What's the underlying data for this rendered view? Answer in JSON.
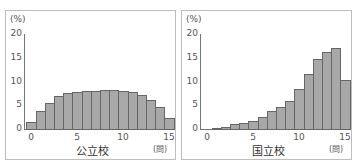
{
  "chart_data": [
    {
      "type": "bar",
      "title": "公立校",
      "xlabel": "(問)",
      "ylabel": "(%)",
      "ylim": [
        0,
        20
      ],
      "yticks": [
        0,
        5,
        10,
        15,
        20
      ],
      "xticks": [
        0,
        5,
        10,
        15
      ],
      "categories": [
        0,
        1,
        2,
        3,
        4,
        5,
        6,
        7,
        8,
        9,
        10,
        11,
        12,
        13,
        14,
        15
      ],
      "values": [
        1.5,
        3.8,
        5.5,
        6.9,
        7.5,
        7.8,
        8.0,
        8.0,
        8.2,
        8.3,
        8.0,
        7.7,
        7.1,
        6.1,
        4.6,
        2.3
      ]
    },
    {
      "type": "bar",
      "title": "国立校",
      "xlabel": "(問)",
      "ylabel": "(%)",
      "ylim": [
        0,
        20
      ],
      "yticks": [
        0,
        5,
        10,
        15,
        20
      ],
      "xticks": [
        0,
        5,
        10,
        15
      ],
      "categories": [
        1,
        2,
        3,
        4,
        5,
        6,
        7,
        8,
        9,
        10,
        11,
        12,
        13,
        14,
        15
      ],
      "values": [
        0.2,
        0.4,
        1.0,
        1.2,
        1.7,
        2.5,
        3.7,
        4.7,
        5.9,
        8.4,
        11.5,
        14.7,
        16.2,
        17.1,
        10.3
      ]
    }
  ],
  "labels": {
    "unit": "(%)",
    "xunit": "(問)",
    "left_title": "公立校",
    "right_title": "国立校"
  }
}
